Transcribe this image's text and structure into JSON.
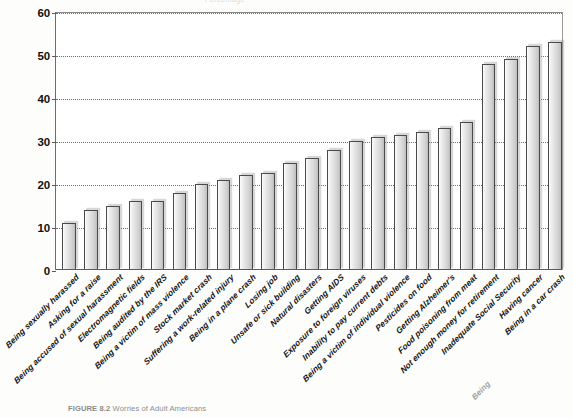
{
  "figure": {
    "caption_number": "FIGURE 8.2",
    "caption_text": "Worries of Adult Americans",
    "top_strip_text": "Percentage"
  },
  "chart_data": {
    "type": "bar",
    "title": "Worries of Adult Americans",
    "xlabel": "",
    "ylabel": "",
    "ylim": [
      0,
      60
    ],
    "yticks": [
      0,
      10,
      20,
      30,
      40,
      50,
      60
    ],
    "ytick_labels": [
      "0",
      "10",
      "20",
      "30",
      "40",
      "50",
      "60"
    ],
    "grid": "horizontal-dotted",
    "legend": "none",
    "orientation": "vertical",
    "sorted": "ascending",
    "bar_count": 23,
    "categories": [
      "Being sexually harassed",
      "Asking for a raise",
      "Being accused of sexual harassment",
      "Electromagnetic fields",
      "Being audited by the IRS",
      "Being a victim of mass violence",
      "Stock market crash",
      "Suffering a work-related injury",
      "Being in a plane crash",
      "Losing job",
      "Unsafe or sick building",
      "Natural disasters",
      "Getting AIDS",
      "Exposure to foreign viruses",
      "Inability to pay current debts",
      "Being a victim of individual violence",
      "Pesticides on food",
      "Getting Alzheimer's",
      "Food poisoning from meat",
      "Not enough money for retirement",
      "Inadequate Social Security",
      "Having cancer",
      "Being in a car crash"
    ],
    "values": [
      11,
      14,
      15,
      16,
      16,
      18,
      20,
      21,
      22,
      22.5,
      25,
      26,
      28,
      30,
      31,
      31.5,
      32,
      33,
      34.5,
      48,
      49,
      52,
      53
    ]
  },
  "style": {
    "bar_border": "#4a4a4a",
    "bar_fill_light": "#fdfdfd",
    "bar_fill_dark": "#bdbdbd",
    "gridline": "#6f6f6f",
    "axis": "#5b5b5b",
    "text": "#111111",
    "background": "#ffffff"
  }
}
